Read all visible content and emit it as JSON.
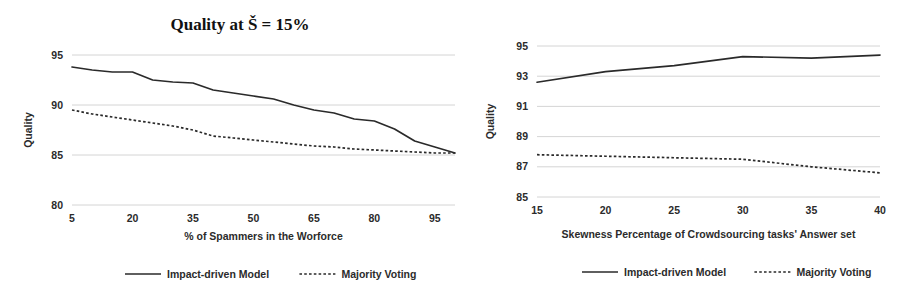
{
  "figure": {
    "background_color": "#ffffff",
    "line_color": "#2a2a2a",
    "grid_color": "#c9c9c9"
  },
  "chart_data": [
    {
      "id": "left",
      "type": "line",
      "title": "Quality  at  Š = 15%",
      "xlabel": "% of Spammers in the Worforce",
      "ylabel": "Quality",
      "xlim": [
        5,
        100
      ],
      "ylim": [
        80,
        95
      ],
      "xticks": [
        5,
        20,
        35,
        50,
        65,
        80,
        95
      ],
      "xtick_labels": [
        "5",
        "20",
        "35",
        "50",
        "65",
        "80",
        "95"
      ],
      "yticks": [
        80,
        85,
        90,
        95
      ],
      "ytick_labels": [
        "80",
        "85",
        "90",
        "95"
      ],
      "grid": true,
      "legend_position": "bottom",
      "x": [
        5,
        10,
        15,
        20,
        25,
        30,
        35,
        40,
        45,
        50,
        55,
        60,
        65,
        70,
        75,
        80,
        85,
        90,
        95,
        100
      ],
      "series": [
        {
          "name": "Impact-driven Model",
          "style": "solid",
          "values": [
            93.8,
            93.5,
            93.3,
            93.3,
            92.5,
            92.3,
            92.2,
            91.5,
            91.2,
            90.9,
            90.6,
            90.0,
            89.5,
            89.2,
            88.6,
            88.4,
            87.6,
            86.4,
            85.8,
            85.2
          ]
        },
        {
          "name": "Majority Voting",
          "style": "dotted",
          "values": [
            89.5,
            89.1,
            88.8,
            88.5,
            88.2,
            87.9,
            87.5,
            86.9,
            86.7,
            86.5,
            86.3,
            86.1,
            85.9,
            85.8,
            85.6,
            85.5,
            85.4,
            85.3,
            85.2,
            85.2
          ]
        }
      ]
    },
    {
      "id": "right",
      "type": "line",
      "title": "",
      "xlabel": "Skewness Percentage of  Crowdsourcing tasks' Answer set",
      "ylabel": "Quality",
      "xlim": [
        15,
        40
      ],
      "ylim": [
        85,
        95
      ],
      "xticks": [
        15,
        20,
        25,
        30,
        35,
        40
      ],
      "xtick_labels": [
        "15",
        "20",
        "25",
        "30",
        "35",
        "40"
      ],
      "yticks": [
        85,
        87,
        89,
        91,
        93,
        95
      ],
      "ytick_labels": [
        "85",
        "87",
        "89",
        "91",
        "93",
        "95"
      ],
      "grid": true,
      "legend_position": "bottom",
      "x": [
        15,
        20,
        25,
        30,
        35,
        40
      ],
      "series": [
        {
          "name": "Impact-driven Model",
          "style": "solid",
          "values": [
            92.6,
            93.3,
            93.7,
            94.3,
            94.2,
            94.4
          ]
        },
        {
          "name": "Majority Voting",
          "style": "dotted",
          "values": [
            87.8,
            87.7,
            87.6,
            87.5,
            87.0,
            86.6
          ]
        }
      ]
    }
  ]
}
